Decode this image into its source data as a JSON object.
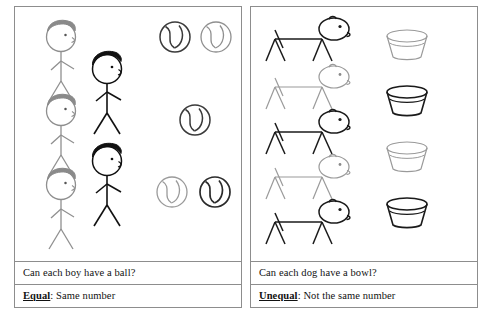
{
  "worksheet": {
    "panels": [
      {
        "id": "equal-panel",
        "question": "Can each boy have a ball?",
        "answer_keyword": "Equal",
        "answer_rest": ": Same number",
        "subject_label": "boy",
        "object_label": "ball",
        "subject_count": 5,
        "object_count": 5,
        "relation": "equal"
      },
      {
        "id": "unequal-panel",
        "question": "Can each dog have a bowl?",
        "answer_keyword": "Unequal",
        "answer_rest": ": Not the same number",
        "subject_label": "dog",
        "object_label": "bowl",
        "subject_count": 5,
        "object_count": 4,
        "relation": "unequal"
      }
    ]
  },
  "figures": {
    "boys": [
      {
        "x": 40,
        "y": 18,
        "scale": 1.0,
        "hair": "gray",
        "ink": "#8f8f8f"
      },
      {
        "x": 86,
        "y": 48,
        "scale": 1.0,
        "hair": "black",
        "ink": "#111111"
      },
      {
        "x": 40,
        "y": 92,
        "scale": 1.0,
        "hair": "gray",
        "ink": "#9a9a9a"
      },
      {
        "x": 86,
        "y": 142,
        "scale": 1.0,
        "hair": "black",
        "ink": "#111111"
      },
      {
        "x": 40,
        "y": 165,
        "scale": 1.0,
        "hair": "gray",
        "ink": "#8f8f8f"
      }
    ],
    "balls": [
      {
        "cx": 166,
        "cy": 35,
        "r": 15,
        "ink": "#3a3a3a"
      },
      {
        "cx": 207,
        "cy": 35,
        "r": 15,
        "ink": "#8f8f8f"
      },
      {
        "cx": 186,
        "cy": 118,
        "r": 15,
        "ink": "#3a3a3a"
      },
      {
        "cx": 163,
        "cy": 190,
        "r": 15,
        "ink": "#9a9a9a"
      },
      {
        "cx": 206,
        "cy": 190,
        "r": 15,
        "ink": "#3a3a3a"
      }
    ],
    "dogs": [
      {
        "x": 14,
        "y": 14,
        "ink": "#222222"
      },
      {
        "x": 14,
        "y": 62,
        "ink": "#9a9a9a"
      },
      {
        "x": 14,
        "y": 105,
        "ink": "#1a1a1a"
      },
      {
        "x": 14,
        "y": 148,
        "ink": "#a2a2a2"
      },
      {
        "x": 14,
        "y": 192,
        "ink": "#1a1a1a"
      }
    ],
    "bowls": [
      {
        "cx": 157,
        "cy": 35,
        "ink": "#9a9a9a"
      },
      {
        "cx": 157,
        "cy": 92,
        "ink": "#1a1a1a"
      },
      {
        "cx": 157,
        "cy": 148,
        "ink": "#9a9a9a"
      },
      {
        "cx": 157,
        "cy": 205,
        "ink": "#1a1a1a"
      }
    ]
  },
  "colors": {
    "border": "#8d8d8d",
    "ink_dark": "#111111",
    "ink_light": "#9a9a9a",
    "hair_gray": "#8a8a8a",
    "hair_black": "#111111",
    "paper": "#ffffff"
  }
}
